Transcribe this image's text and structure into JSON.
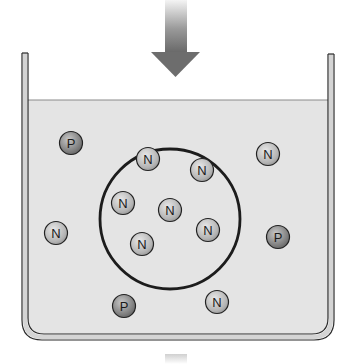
{
  "diagram": {
    "colors": {
      "background": "#ffffff",
      "liquid": "#e4e4e4",
      "wall_outline": "#2a2a2a",
      "wall_fill": "#d8d8d8",
      "circle_stroke": "#1c1c1c",
      "arrow_dark": "#6e6e6e",
      "arrow_light": "#f2f2f2",
      "particle_N_fill": "#bdbdbd",
      "particle_P_fill": "#8a8a8a"
    },
    "arrow": {
      "direction": "down",
      "position": "top-center"
    },
    "enclosure_circle": {
      "cx": 170,
      "cy": 219,
      "r": 70
    },
    "particles": [
      {
        "label": "P",
        "cx": 71,
        "cy": 143,
        "inside_circle": false
      },
      {
        "label": "N",
        "cx": 148,
        "cy": 159,
        "inside_circle": true
      },
      {
        "label": "N",
        "cx": 202,
        "cy": 170,
        "inside_circle": true
      },
      {
        "label": "N",
        "cx": 268,
        "cy": 154,
        "inside_circle": false
      },
      {
        "label": "N",
        "cx": 123,
        "cy": 203,
        "inside_circle": true
      },
      {
        "label": "N",
        "cx": 170,
        "cy": 210,
        "inside_circle": true
      },
      {
        "label": "N",
        "cx": 208,
        "cy": 230,
        "inside_circle": true
      },
      {
        "label": "N",
        "cx": 142,
        "cy": 244,
        "inside_circle": true
      },
      {
        "label": "N",
        "cx": 56,
        "cy": 233,
        "inside_circle": false
      },
      {
        "label": "P",
        "cx": 278,
        "cy": 237,
        "inside_circle": false
      },
      {
        "label": "P",
        "cx": 124,
        "cy": 306,
        "inside_circle": false
      },
      {
        "label": "N",
        "cx": 217,
        "cy": 302,
        "inside_circle": false
      }
    ],
    "counts": {
      "N": 9,
      "P": 3,
      "N_inside_circle": 6
    }
  }
}
